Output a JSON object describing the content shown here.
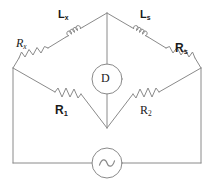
{
  "diagram": {
    "stroke_color": "#8a8a8a",
    "label_color": "#1a1a1a",
    "background": "#ffffff",
    "components": {
      "inductor_unknown": {
        "label_main": "L",
        "label_sub": "x",
        "name": "inductor-lx"
      },
      "inductor_standard": {
        "label_main": "L",
        "label_sub": "s",
        "name": "inductor-ls"
      },
      "resistor_unknown": {
        "label_main": "R",
        "label_sub": "x",
        "name": "resistor-rx"
      },
      "resistor_standard": {
        "label_main": "R",
        "label_sub": "s",
        "name": "resistor-rs"
      },
      "resistor_one": {
        "label_main": "R",
        "label_sub": "1",
        "name": "resistor-r1"
      },
      "resistor_two": {
        "label_main": "R",
        "label_sub": "2",
        "name": "resistor-r2"
      },
      "detector": {
        "label": "D",
        "name": "detector-d"
      },
      "source": {
        "label": "",
        "symbol": "sine-wave",
        "name": "ac-source"
      }
    }
  }
}
